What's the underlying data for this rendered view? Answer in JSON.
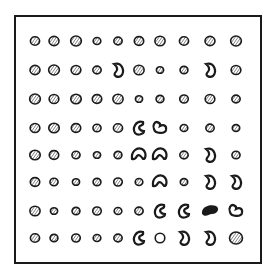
{
  "figure": {
    "title": "",
    "rows": 8,
    "cols": 10,
    "ink_color": "#1a1a1a",
    "background": "#ffffff",
    "col_x": [
      35,
      54,
      76,
      97,
      118,
      139,
      160,
      184,
      210,
      236
    ],
    "row_y": [
      41,
      70,
      99,
      128,
      155,
      182,
      211,
      238
    ],
    "shape_types": {
      "H": "hatched-circle",
      "h": "small-hatched-circle",
      "K": "kidney-shape",
      "C": "crescent-shape",
      "B": "bean-shape",
      "U": "curl-shape",
      "S": "solid-blob",
      "O": "empty-circle",
      "L": "large-hatched-circle"
    },
    "grid": [
      [
        "H",
        "H",
        "H",
        "h",
        "h",
        "H",
        "H",
        "H",
        "H",
        "H"
      ],
      [
        "H",
        "H",
        "H",
        "h",
        "K",
        "H",
        "h",
        "h",
        "K",
        "H"
      ],
      [
        "H",
        "H",
        "H",
        "H",
        "H",
        "h",
        "h",
        "h",
        "H",
        "h"
      ],
      [
        "H",
        "H",
        "H",
        "h",
        "H",
        "C",
        "B",
        "h",
        "h",
        "h"
      ],
      [
        "H",
        "H",
        "h",
        "h",
        "h",
        "U",
        "U",
        "h",
        "K",
        "h"
      ],
      [
        "H",
        "h",
        "h",
        "h",
        "h",
        "h",
        "U",
        "h",
        "K",
        "K"
      ],
      [
        "H",
        "h",
        "h",
        "h",
        "h",
        "h",
        "C",
        "C",
        "S",
        "B"
      ],
      [
        "H",
        "h",
        "h",
        "h",
        "h",
        "C",
        "O",
        "K",
        "K",
        "L"
      ]
    ]
  }
}
